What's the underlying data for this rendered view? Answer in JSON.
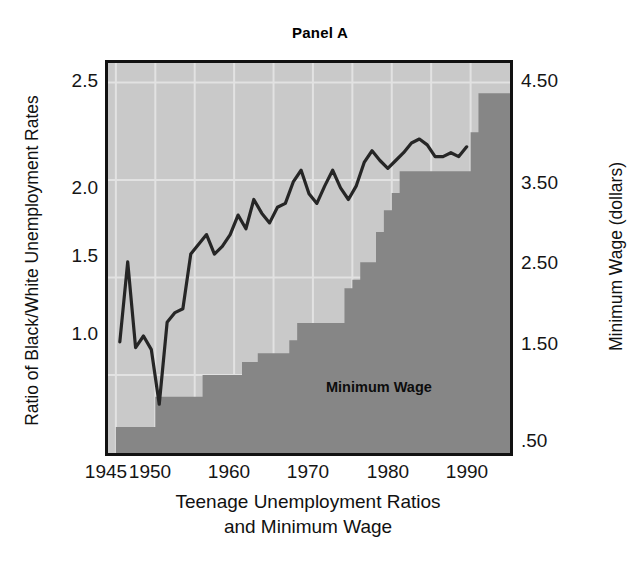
{
  "figure": {
    "title": "Panel A",
    "caption_line1": "Teenage Unemployment Ratios",
    "caption_line2": "and Minimum Wage",
    "series_label_minimum_wage": "Minimum Wage",
    "colors": {
      "plot_background": "#c9c9c9",
      "bar_fill": "#868686",
      "line_stroke": "#262626",
      "gridline": "#e2e2e2",
      "frame": "#111111",
      "text": "#111111"
    }
  },
  "axes": {
    "left": {
      "title": "Ratio of Black/White Unemployment Rates",
      "ticks": [
        "2.5",
        "2.0",
        "1.5",
        "1.0"
      ],
      "tick_values": [
        2.5,
        2.0,
        1.5,
        1.0
      ],
      "range": [
        0.6,
        2.6
      ]
    },
    "right": {
      "title": "Minimum Wage (dollars)",
      "ticks": [
        "4.50",
        "3.50",
        "2.50",
        "1.50",
        ".50"
      ],
      "tick_values": [
        4.5,
        3.5,
        2.5,
        1.5,
        0.5
      ],
      "range": [
        0.1,
        4.6
      ]
    },
    "bottom": {
      "ticks": [
        "1945",
        "1950",
        "1960",
        "1970",
        "1980",
        "1990"
      ],
      "tick_values": [
        1945,
        1950,
        1960,
        1970,
        1980,
        1990
      ],
      "range": [
        1944,
        1995
      ]
    }
  },
  "chart_data": {
    "type": "line",
    "title": "Panel A",
    "xlabel": "Teenage Unemployment Ratios and Minimum Wage",
    "ylabel": "Ratio of Black/White Unemployment Rates",
    "ylabel_secondary": "Minimum Wage (dollars)",
    "xlim": [
      1944,
      1995
    ],
    "ylim": [
      0.6,
      2.6
    ],
    "ylim_secondary": [
      0.1,
      4.6
    ],
    "grid": true,
    "legend": "in-plot annotation",
    "series": [
      {
        "name": "Ratio of Black/White Unemployment Rates",
        "type": "line",
        "axis": "left",
        "color": "#262626",
        "x": [
          1945,
          1946,
          1947,
          1948,
          1949,
          1950,
          1951,
          1952,
          1953,
          1954,
          1955,
          1956,
          1957,
          1958,
          1959,
          1960,
          1961,
          1962,
          1963,
          1964,
          1965,
          1966,
          1967,
          1968,
          1969,
          1970,
          1971,
          1972,
          1973,
          1974,
          1975,
          1976,
          1977,
          1978,
          1979,
          1980,
          1981,
          1982,
          1983,
          1984,
          1985,
          1986,
          1987,
          1988,
          1989
        ],
        "values": [
          1.17,
          1.58,
          1.14,
          1.2,
          1.13,
          0.85,
          1.27,
          1.32,
          1.34,
          1.62,
          1.67,
          1.72,
          1.62,
          1.66,
          1.72,
          1.82,
          1.75,
          1.9,
          1.83,
          1.78,
          1.86,
          1.88,
          1.99,
          2.05,
          1.93,
          1.88,
          1.97,
          2.05,
          1.96,
          1.9,
          1.97,
          2.09,
          2.15,
          2.1,
          2.06,
          2.1,
          2.14,
          2.19,
          2.21,
          2.18,
          2.12,
          2.12,
          2.14,
          2.12,
          2.17
        ]
      },
      {
        "name": "Minimum Wage",
        "type": "step",
        "axis": "right",
        "color": "#868686",
        "x": [
          1945,
          1946,
          1947,
          1948,
          1949,
          1950,
          1951,
          1952,
          1953,
          1954,
          1955,
          1956,
          1957,
          1958,
          1959,
          1960,
          1961,
          1962,
          1963,
          1964,
          1965,
          1966,
          1967,
          1968,
          1969,
          1970,
          1971,
          1972,
          1973,
          1974,
          1975,
          1976,
          1977,
          1978,
          1979,
          1980,
          1981,
          1982,
          1983,
          1984,
          1985,
          1986,
          1987,
          1988,
          1989,
          1990,
          1991,
          1992,
          1993,
          1994
        ],
        "values": [
          0.4,
          0.4,
          0.4,
          0.4,
          0.4,
          0.75,
          0.75,
          0.75,
          0.75,
          0.75,
          0.75,
          1.0,
          1.0,
          1.0,
          1.0,
          1.0,
          1.15,
          1.15,
          1.25,
          1.25,
          1.25,
          1.25,
          1.4,
          1.6,
          1.6,
          1.6,
          1.6,
          1.6,
          1.6,
          2.0,
          2.1,
          2.3,
          2.3,
          2.65,
          2.9,
          3.1,
          3.35,
          3.35,
          3.35,
          3.35,
          3.35,
          3.35,
          3.35,
          3.35,
          3.35,
          3.8,
          4.25,
          4.25,
          4.25,
          4.25
        ]
      }
    ],
    "annotations": [
      {
        "text": "Minimum Wage",
        "x": 1973,
        "y_right": 1.0
      }
    ]
  }
}
